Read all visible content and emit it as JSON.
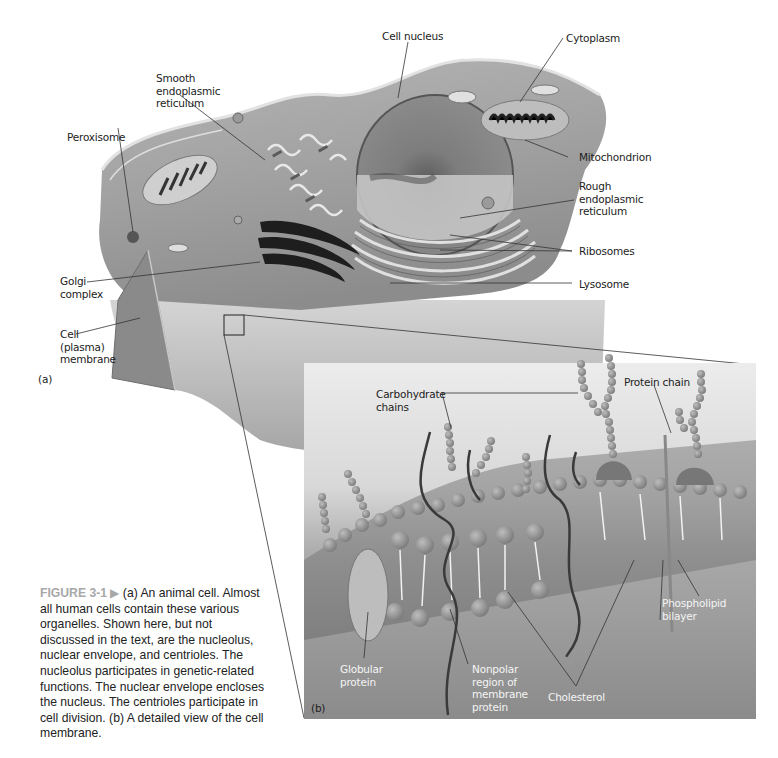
{
  "figure": {
    "number_label": "FIGURE 3-1",
    "arrow_glyph": "▶",
    "caption": " (a) An animal cell. Almost all human cells contain these various organelles. Shown here, but not discussed in the text, are the nucleolus, nuclear envelope, and centrioles. The nucleolus participates in genetic-related functions. The nuclear envelope encloses the nucleus. The centrioles participate in cell division. (b) A detailed view of the cell membrane."
  },
  "panel_a": {
    "panel_label": "(a)",
    "labels": {
      "cell_nucleus": "Cell nucleus",
      "smooth_er": "Smooth\nendoplasmic\nreticulum",
      "cytoplasm": "Cytoplasm",
      "peroxisome": "Peroxisome",
      "mitochondrion": "Mitochondrion",
      "rough_er": "Rough\nendoplasmic\nreticulum",
      "ribosomes": "Ribosomes",
      "golgi": "Golgi\ncomplex",
      "lysosome": "Lysosome",
      "cell_membrane": "Cell\n(plasma)\nmembrane"
    }
  },
  "panel_b": {
    "panel_label": "(b)",
    "labels": {
      "carbohydrate_chains": "Carbohydrate\nchains",
      "protein_chain": "Protein chain",
      "phospholipid_bilayer": "Phospholipid\nbilayer",
      "globular_protein": "Globular\nprotein",
      "nonpolar_region": "Nonpolar\nregion of\nmembrane\nprotein",
      "cholesterol": "Cholesterol"
    }
  },
  "colors": {
    "cell_body": "#9a9a9a",
    "cell_light": "#c9c9c9",
    "nucleus": "#7c7c7c",
    "panel_bg_top": "#e6e6e6",
    "panel_bg_bottom": "#8a8a8a",
    "bead": "#8f8f8f",
    "caption_accent": "#a8a8a8"
  }
}
